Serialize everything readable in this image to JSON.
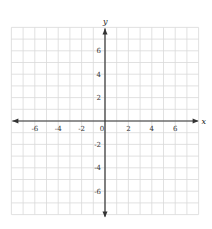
{
  "chart_data": {
    "type": "coordinate-grid",
    "title": "",
    "xlabel": "x",
    "ylabel": "y",
    "xlim": [
      -8,
      8
    ],
    "ylim": [
      -8,
      8
    ],
    "grid": true,
    "grid_step": 1,
    "x_ticks": [
      -6,
      -4,
      -2,
      0,
      2,
      4,
      6
    ],
    "y_ticks": [
      -6,
      -4,
      -2,
      2,
      4,
      6
    ],
    "x_tick_labels": [
      "-6",
      "-4",
      "-2",
      "0",
      "2",
      "4",
      "6"
    ],
    "y_tick_labels": [
      "-6",
      "-4",
      "-2",
      "2",
      "4",
      "6"
    ],
    "origin_label": "0",
    "series": []
  },
  "colors": {
    "grid": "#d9d9d9",
    "axis": "#333333",
    "background": "#ffffff"
  },
  "layout": {
    "x0": 105,
    "y0": 121,
    "unit": 11.7,
    "grid_left": 12,
    "grid_right": 199,
    "grid_top": 25,
    "grid_bottom": 216
  }
}
